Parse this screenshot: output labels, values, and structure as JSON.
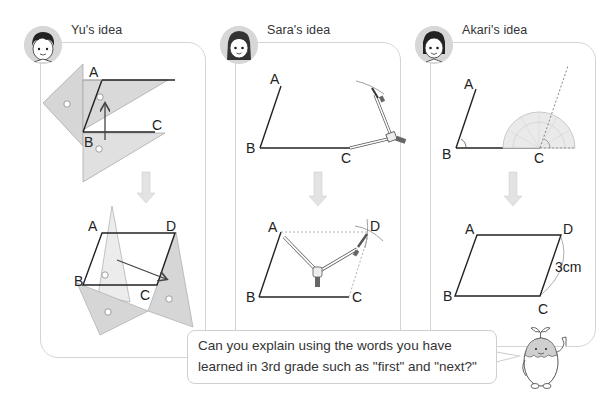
{
  "panels": [
    {
      "id": "yu",
      "title": "Yu's idea",
      "method": "sliding triangle rulers",
      "top_figure": {
        "labels": [
          "A",
          "B",
          "C"
        ]
      },
      "bottom_figure": {
        "labels": [
          "A",
          "B",
          "C",
          "D"
        ]
      }
    },
    {
      "id": "sara",
      "title": "Sara's idea",
      "method": "compass",
      "top_figure": {
        "labels": [
          "A",
          "B",
          "C"
        ]
      },
      "bottom_figure": {
        "labels": [
          "A",
          "B",
          "C",
          "D"
        ]
      }
    },
    {
      "id": "akari",
      "title": "Akari's idea",
      "method": "protractor",
      "top_figure": {
        "labels": [
          "A",
          "B",
          "C"
        ]
      },
      "bottom_figure": {
        "labels": [
          "A",
          "B",
          "C",
          "D"
        ],
        "measurement": "3cm"
      }
    }
  ],
  "speech_bubble": {
    "line1": "Can you explain using the words you have",
    "line2": "learned in 3rd grade such as \"first\" and \"next?\""
  },
  "colors": {
    "panel_border": "#d4d4d4",
    "triangle_fill": "#d6d6d6",
    "arrow_fill": "#e2e2e2",
    "line": "#222222"
  }
}
